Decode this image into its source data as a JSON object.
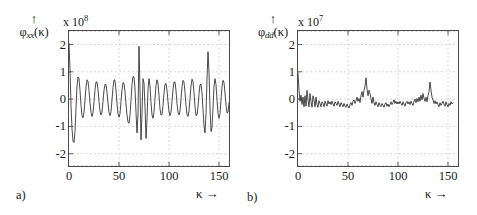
{
  "figure": {
    "kappa_symbol": "κ",
    "arrow_glyph": "↑",
    "right_arrow_glyph": "→"
  },
  "panels": [
    {
      "tag": "a)",
      "ylabel_base": "φ",
      "ylabel_sub": "xx",
      "ylabel_arg": "(κ)",
      "multiplier_text": "x 10",
      "multiplier_exp": "8",
      "xaxis_name": "κ",
      "yticks": [
        "2",
        "1",
        "0",
        "-1",
        "-2"
      ],
      "xticks": [
        "0",
        "50",
        "100",
        "150"
      ]
    },
    {
      "tag": "b)",
      "ylabel_base": "φ",
      "ylabel_sub": "dd",
      "ylabel_arg": "(κ)",
      "multiplier_text": "x 10",
      "multiplier_exp": "7",
      "xaxis_name": "κ",
      "yticks": [
        "2",
        "1",
        "0",
        "-1",
        "-2"
      ],
      "xticks": [
        "0",
        "50",
        "100",
        "150"
      ]
    }
  ],
  "chart_data": [
    {
      "type": "line",
      "panel": "a)",
      "title": "",
      "xlabel": "κ",
      "ylabel": "φ_xx(κ)",
      "y_multiplier": 100000000.0,
      "xlim": [
        0,
        160
      ],
      "ylim": [
        -2.45,
        2.45
      ],
      "xticks": [
        0,
        50,
        100,
        150
      ],
      "yticks": [
        -2,
        -1,
        0,
        1,
        2
      ],
      "grid": true,
      "legend": null,
      "x": [
        0,
        1,
        2,
        3,
        4,
        5,
        6,
        7,
        8,
        9,
        10,
        11,
        12,
        13,
        14,
        15,
        16,
        17,
        18,
        19,
        20,
        21,
        22,
        23,
        24,
        25,
        26,
        27,
        28,
        29,
        30,
        31,
        32,
        33,
        34,
        35,
        36,
        37,
        38,
        39,
        40,
        41,
        42,
        43,
        44,
        45,
        46,
        47,
        48,
        49,
        50,
        51,
        52,
        53,
        54,
        55,
        56,
        57,
        58,
        59,
        60,
        61,
        62,
        63,
        64,
        65,
        66,
        67,
        68,
        69,
        70,
        71,
        72,
        73,
        74,
        75,
        76,
        77,
        78,
        79,
        80,
        81,
        82,
        83,
        84,
        85,
        86,
        87,
        88,
        89,
        90,
        91,
        92,
        93,
        94,
        95,
        96,
        97,
        98,
        99,
        100,
        101,
        102,
        103,
        104,
        105,
        106,
        107,
        108,
        109,
        110,
        111,
        112,
        113,
        114,
        115,
        116,
        117,
        118,
        119,
        120,
        121,
        122,
        123,
        124,
        125,
        126,
        127,
        128,
        129,
        130,
        131,
        132,
        133,
        134,
        135,
        136,
        137,
        138,
        139,
        140,
        141,
        142,
        143,
        144,
        145,
        146,
        147,
        148,
        149,
        150,
        151,
        152,
        153,
        154,
        155,
        156,
        157,
        158,
        159,
        160
      ],
      "values": [
        2.0,
        1.05,
        -0.25,
        -1.1,
        -1.55,
        -1.6,
        -1.2,
        -0.35,
        0.45,
        0.78,
        0.72,
        0.3,
        -0.25,
        -0.62,
        -0.7,
        -0.5,
        -0.05,
        0.42,
        0.68,
        0.62,
        0.3,
        -0.15,
        -0.5,
        -0.65,
        -0.52,
        -0.12,
        0.32,
        0.6,
        0.6,
        0.32,
        -0.1,
        -0.45,
        -0.6,
        -0.5,
        -0.1,
        0.3,
        0.52,
        0.5,
        0.22,
        -0.18,
        -0.5,
        -0.62,
        -0.48,
        -0.05,
        0.4,
        0.68,
        0.66,
        0.3,
        -0.2,
        -0.55,
        -0.68,
        -0.55,
        -0.12,
        0.32,
        0.58,
        0.55,
        0.25,
        -0.2,
        -0.6,
        -0.85,
        -0.9,
        -0.62,
        -0.05,
        0.5,
        0.8,
        0.78,
        0.35,
        -0.5,
        -1.25,
        -0.6,
        1.9,
        0.3,
        -1.5,
        -0.55,
        0.72,
        0.55,
        -0.3,
        -1.45,
        -0.75,
        0.35,
        0.72,
        0.45,
        -0.15,
        -0.6,
        -0.72,
        -0.5,
        0.0,
        0.48,
        0.68,
        0.55,
        0.1,
        -0.38,
        -0.6,
        -0.58,
        -0.25,
        0.2,
        0.52,
        0.55,
        0.3,
        -0.12,
        -0.48,
        -0.62,
        -0.5,
        -0.1,
        0.32,
        0.6,
        0.6,
        0.28,
        -0.18,
        -0.5,
        -0.6,
        -0.45,
        -0.02,
        0.42,
        0.66,
        0.6,
        0.22,
        -0.25,
        -0.58,
        -0.65,
        -0.45,
        0.0,
        0.45,
        0.7,
        0.62,
        0.22,
        -0.3,
        -0.62,
        -0.6,
        -0.3,
        0.15,
        0.5,
        0.52,
        0.2,
        -0.4,
        -1.0,
        -1.25,
        -0.55,
        0.7,
        1.7,
        0.95,
        -0.35,
        -1.2,
        -1.05,
        -0.35,
        0.45,
        0.72,
        0.5,
        -0.05,
        -0.55,
        -0.72,
        -0.55,
        -0.05,
        0.42,
        0.66,
        0.58,
        0.2,
        -0.25,
        -0.52,
        -0.5,
        -0.15,
        0.3,
        0.52
      ],
      "annotations": [
        {
          "text": "initial spike at κ=0 reaching +2.0×10^8"
        },
        {
          "text": "large positive spike at κ≈68 reaching +1.9×10^8"
        },
        {
          "text": "large positive spike at κ≈137 reaching +1.7×10^8"
        },
        {
          "text": "quasi-periodic oscillation, period ≈ 8 lags, envelope ±0.5–0.8×10^8"
        }
      ]
    },
    {
      "type": "line",
      "panel": "b)",
      "title": "",
      "xlabel": "κ",
      "ylabel": "φ_dd(κ)",
      "y_multiplier": 10000000.0,
      "xlim": [
        0,
        160
      ],
      "ylim": [
        -2.45,
        2.45
      ],
      "xticks": [
        0,
        50,
        100,
        150
      ],
      "yticks": [
        -2,
        -1,
        0,
        1,
        2
      ],
      "grid": true,
      "legend": null,
      "x": [
        0,
        1,
        2,
        3,
        4,
        5,
        6,
        7,
        8,
        9,
        10,
        11,
        12,
        13,
        14,
        15,
        16,
        17,
        18,
        19,
        20,
        21,
        22,
        23,
        24,
        25,
        26,
        27,
        28,
        29,
        30,
        31,
        32,
        33,
        34,
        35,
        36,
        37,
        38,
        39,
        40,
        41,
        42,
        43,
        44,
        45,
        46,
        47,
        48,
        49,
        50,
        51,
        52,
        53,
        54,
        55,
        56,
        57,
        58,
        59,
        60,
        61,
        62,
        63,
        64,
        65,
        66,
        67,
        68,
        69,
        70,
        71,
        72,
        73,
        74,
        75,
        76,
        77,
        78,
        79,
        80,
        81,
        82,
        83,
        84,
        85,
        86,
        87,
        88,
        89,
        90,
        91,
        92,
        93,
        94,
        95,
        96,
        97,
        98,
        99,
        100,
        101,
        102,
        103,
        104,
        105,
        106,
        107,
        108,
        109,
        110,
        111,
        112,
        113,
        114,
        115,
        116,
        117,
        118,
        119,
        120,
        121,
        122,
        123,
        124,
        125,
        126,
        127,
        128,
        129,
        130,
        131,
        132,
        133,
        134,
        135,
        136,
        137,
        138,
        139,
        140,
        141,
        142,
        143,
        144,
        145,
        146,
        147,
        148,
        149,
        150,
        151,
        152,
        153,
        154,
        155,
        156,
        157,
        158,
        159,
        160
      ],
      "values": [
        0.92,
        0.3,
        -0.1,
        0.12,
        -0.22,
        0.05,
        -0.3,
        0.1,
        -0.28,
        0.3,
        -0.05,
        -0.3,
        0.18,
        -0.12,
        -0.32,
        0.1,
        -0.05,
        -0.3,
        0.05,
        -0.22,
        -0.32,
        -0.08,
        -0.18,
        -0.3,
        -0.12,
        -0.18,
        -0.3,
        -0.1,
        -0.2,
        -0.28,
        -0.08,
        -0.2,
        -0.12,
        -0.22,
        -0.1,
        -0.2,
        -0.28,
        -0.12,
        -0.18,
        -0.25,
        -0.1,
        -0.2,
        -0.3,
        -0.15,
        -0.22,
        -0.3,
        -0.18,
        -0.28,
        -0.32,
        -0.2,
        -0.28,
        -0.35,
        -0.22,
        -0.15,
        -0.25,
        -0.1,
        -0.05,
        -0.18,
        -0.08,
        0.05,
        -0.1,
        0.0,
        -0.15,
        0.1,
        0.25,
        0.05,
        0.3,
        0.45,
        0.75,
        0.35,
        0.1,
        0.3,
        0.18,
        0.0,
        -0.18,
        0.05,
        -0.15,
        -0.25,
        -0.12,
        -0.22,
        -0.3,
        -0.15,
        -0.25,
        -0.3,
        -0.18,
        -0.25,
        -0.32,
        -0.2,
        -0.15,
        -0.28,
        -0.2,
        -0.3,
        -0.22,
        -0.12,
        -0.22,
        -0.15,
        -0.05,
        -0.18,
        -0.1,
        -0.2,
        -0.12,
        -0.2,
        -0.1,
        -0.18,
        -0.25,
        -0.12,
        -0.2,
        -0.28,
        -0.15,
        -0.1,
        -0.2,
        -0.12,
        -0.22,
        -0.1,
        -0.18,
        -0.25,
        -0.1,
        -0.02,
        -0.15,
        0.0,
        -0.12,
        0.05,
        -0.1,
        0.12,
        -0.05,
        0.18,
        0.0,
        -0.1,
        0.05,
        -0.12,
        0.1,
        0.25,
        0.6,
        0.3,
        0.05,
        -0.05,
        -0.18,
        -0.08,
        -0.2,
        -0.12,
        -0.22,
        -0.3,
        -0.15,
        -0.25,
        -0.18,
        -0.1,
        -0.2,
        -0.28,
        -0.12,
        -0.22,
        -0.3,
        -0.18,
        -0.25,
        -0.12,
        -0.2,
        -0.15
      ],
      "annotations": [
        {
          "text": "initial spike at κ=0 reaching +0.92×10^7"
        },
        {
          "text": "spike at κ≈68 reaching +0.75×10^7"
        },
        {
          "text": "spike at κ≈137 reaching +0.6×10^7"
        },
        {
          "text": "broadband low-amplitude noise floor around −0.2×10^7"
        }
      ]
    }
  ]
}
